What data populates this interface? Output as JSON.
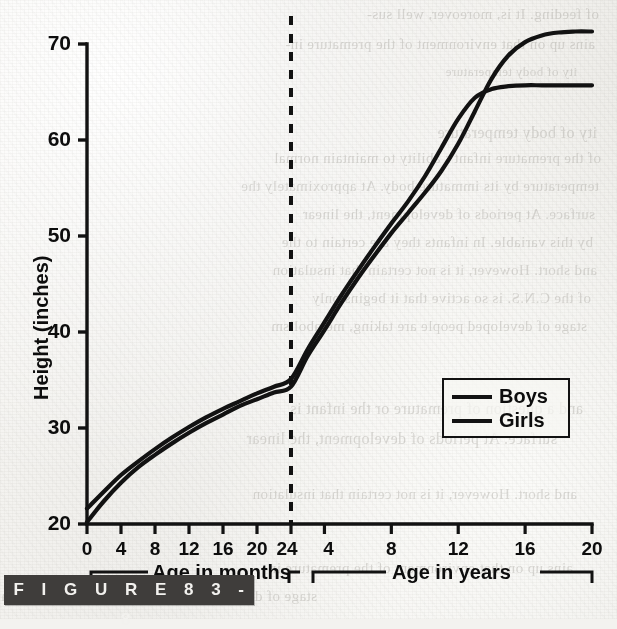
{
  "figure": {
    "caption_label": "F I G U R E   8 3   -   8",
    "bar_color": "#3f3d3b",
    "ink_color": "#121212",
    "paper_color": "#f3f2ef"
  },
  "chart_data": {
    "type": "line",
    "title": "",
    "xlabel": "",
    "ylabel": "Height (inches)",
    "ylim": [
      20,
      70
    ],
    "grid": false,
    "legend_position": "center-right",
    "axis_note": "Dual x-axis: months 0-24 on left segment, years 4-20 on right segment, separated by a vertical dashed line at 24 months.",
    "divider": {
      "style": "dashed",
      "at_label": "24 months"
    },
    "y_ticks": [
      20,
      30,
      40,
      50,
      60,
      70
    ],
    "x_axis_segments": [
      {
        "name": "months",
        "group_label": "Age in months",
        "unit": "months",
        "ticks": [
          0,
          4,
          8,
          12,
          16,
          20,
          24
        ]
      },
      {
        "name": "years",
        "group_label": "Age in years",
        "unit": "years",
        "ticks": [
          4,
          8,
          12,
          16,
          20
        ]
      }
    ],
    "series": [
      {
        "name": "Boys",
        "color": "#121212",
        "points_months": [
          [
            0,
            20.2
          ],
          [
            2,
            22.4
          ],
          [
            4,
            24.3
          ],
          [
            6,
            25.9
          ],
          [
            8,
            27.2
          ],
          [
            10,
            28.4
          ],
          [
            12,
            29.5
          ],
          [
            14,
            30.5
          ],
          [
            16,
            31.4
          ],
          [
            18,
            32.3
          ],
          [
            20,
            33.0
          ],
          [
            22,
            33.7
          ],
          [
            24,
            34.3
          ]
        ],
        "points_years": [
          [
            2,
            34.3
          ],
          [
            3,
            37.5
          ],
          [
            4,
            40.2
          ],
          [
            5,
            43.0
          ],
          [
            6,
            45.6
          ],
          [
            7,
            48.0
          ],
          [
            8,
            50.3
          ],
          [
            9,
            52.4
          ],
          [
            10,
            54.5
          ],
          [
            11,
            56.8
          ],
          [
            12,
            59.6
          ],
          [
            13,
            63.0
          ],
          [
            14,
            66.4
          ],
          [
            15,
            68.8
          ],
          [
            16,
            70.2
          ],
          [
            17,
            70.9
          ],
          [
            18,
            71.2
          ],
          [
            19,
            71.3
          ],
          [
            20,
            71.3
          ]
        ]
      },
      {
        "name": "Girls",
        "color": "#121212",
        "points_months": [
          [
            0,
            21.6
          ],
          [
            2,
            23.4
          ],
          [
            4,
            25.1
          ],
          [
            6,
            26.5
          ],
          [
            8,
            27.8
          ],
          [
            10,
            29.0
          ],
          [
            12,
            30.1
          ],
          [
            14,
            31.1
          ],
          [
            16,
            32.0
          ],
          [
            18,
            32.8
          ],
          [
            20,
            33.6
          ],
          [
            22,
            34.3
          ],
          [
            24,
            35.1
          ]
        ],
        "points_years": [
          [
            2,
            35.1
          ],
          [
            3,
            38.2
          ],
          [
            4,
            41.0
          ],
          [
            5,
            43.8
          ],
          [
            6,
            46.4
          ],
          [
            7,
            48.9
          ],
          [
            8,
            51.3
          ],
          [
            9,
            53.6
          ],
          [
            10,
            56.2
          ],
          [
            11,
            59.2
          ],
          [
            12,
            62.2
          ],
          [
            13,
            64.4
          ],
          [
            14,
            65.3
          ],
          [
            15,
            65.6
          ],
          [
            16,
            65.7
          ],
          [
            17,
            65.7
          ],
          [
            18,
            65.7
          ],
          [
            19,
            65.7
          ],
          [
            20,
            65.7
          ]
        ]
      }
    ],
    "legend": [
      {
        "label": "Boys",
        "swatch": "solid-line"
      },
      {
        "label": "Girls",
        "swatch": "solid-line"
      }
    ],
    "annotations": [
      "Girls' curve rises above boys' during early adolescence and the two cross at about 13 years near 65 inches.",
      "Girls plateau near 65.7 inches; boys continue to about 71 inches."
    ]
  },
  "bleed_through": {
    "lines": [
      "of feeding. It is, moreover, well sus-",
      "ains up on that environment of the premature in-",
      "ity of body temperature",
      "of the premature infant's ability to maintain normal",
      "temperature by its immature body. At approximately the",
      "surface. At periods of development, the linear",
      "by this variable. In infants they are certain to the",
      "and short. However, it is not certain that insulation",
      "of the C.N.S. is so active that it begins only",
      "stage of developed people are taking, metabolism",
      "and a question of premature or the infant is"
    ]
  }
}
